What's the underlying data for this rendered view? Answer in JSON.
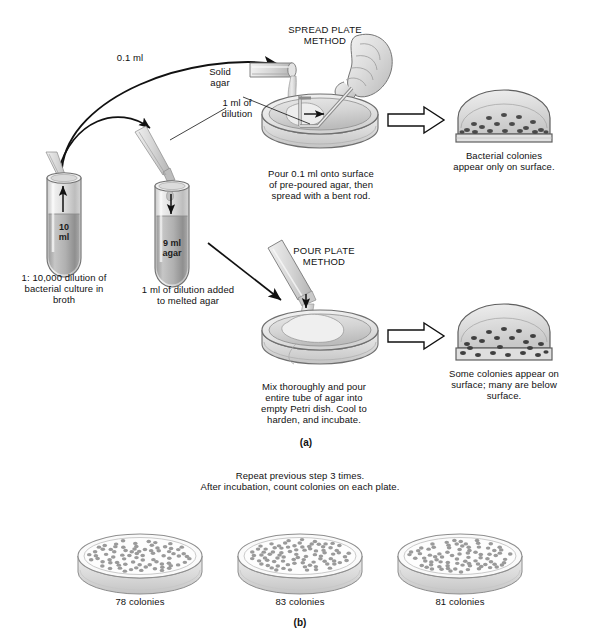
{
  "figure": {
    "title_hidden": "Plate count technique",
    "panel_a_label": "(a)",
    "panel_b_label": "(b)"
  },
  "flow": {
    "volume_spread": "0.1 ml",
    "volume_pour": "1 ml of\ndilution",
    "volume_pour_line1": "1 ml of",
    "volume_pour_line2": "dilution"
  },
  "tubes": [
    {
      "name": "broth-tube",
      "inner_line1": "10",
      "inner_line2": "ml",
      "caption_line1": "1: 10,000 dilution of",
      "caption_line2": "bacterial culture in",
      "caption_line3": "broth"
    },
    {
      "name": "agar-tube",
      "inner_line1": "9 ml",
      "inner_line2": "agar",
      "caption_line1": "1 ml of dilution added",
      "caption_line2": "to melted agar"
    }
  ],
  "spread_plate": {
    "heading_line1": "SPREAD PLATE",
    "heading_line2": "METHOD",
    "agar_label_line1": "Solid",
    "agar_label_line2": "agar",
    "instruction_line1": "Pour 0.1 ml onto surface",
    "instruction_line2": "of pre-poured agar, then",
    "instruction_line3": "spread with a bent rod.",
    "result_line1": "Bacterial colonies",
    "result_line2": "appear only on surface."
  },
  "pour_plate": {
    "heading_line1": "POUR PLATE",
    "heading_line2": "METHOD",
    "instruction_line1": "Mix thoroughly and pour",
    "instruction_line2": "entire tube of agar into",
    "instruction_line3": "empty Petri dish. Cool to",
    "instruction_line4": "harden, and incubate.",
    "result_line1": "Some colonies appear on",
    "result_line2": "surface; many are below",
    "result_line3": "surface."
  },
  "panel_b": {
    "heading_line1": "Repeat previous step 3 times.",
    "heading_line2": "After incubation, count colonies on each plate.",
    "plates": [
      {
        "count_label": "78 colonies",
        "count": 78
      },
      {
        "count_label": "83 colonies",
        "count": 83
      },
      {
        "count_label": "81 colonies",
        "count": 81
      }
    ]
  },
  "colors": {
    "ink": "#1a1a1a",
    "glass_light": "#e8e8e8",
    "glass_mid": "#cfcfcf",
    "liquid": "#b4b4b4",
    "agar_fill": "#d8d8d8",
    "colony": "#6d6d6d",
    "outline": "#4a4a4a"
  }
}
